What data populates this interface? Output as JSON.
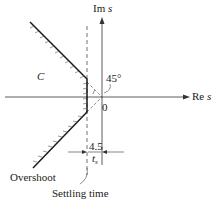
{
  "diagram": {
    "type": "s-plane region",
    "axes": {
      "imaginary_label": "Im",
      "imaginary_var": "s",
      "real_label": "Re",
      "real_var": "s",
      "origin_label": "0"
    },
    "region_label": "C",
    "angle_label": "45°",
    "settling": {
      "numerator": "4.5",
      "denominator": "t",
      "denominator_sub": "s"
    },
    "annotations": {
      "overshoot": "Overshoot",
      "settling_time": "Settling time"
    },
    "colors": {
      "line": "#1a1a1a",
      "background": "#ffffff"
    }
  }
}
